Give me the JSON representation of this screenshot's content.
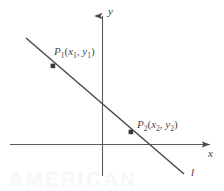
{
  "figure": {
    "type": "coordinate-geometry-diagram",
    "background_color": "#ffffff",
    "ink_color": "#4a4a4a",
    "axes": {
      "x_axis": {
        "label": "x",
        "label_position": {
          "x": 208,
          "y": 148
        },
        "start": {
          "x": 10,
          "y": 144
        },
        "end": {
          "x": 217,
          "y": 144
        },
        "arrow": "right"
      },
      "y_axis": {
        "label": "y",
        "label_position": {
          "x": 108,
          "y": 6
        },
        "start": {
          "x": 102,
          "y": 176
        },
        "end": {
          "x": 102,
          "y": 8
        },
        "arrow": "up"
      },
      "origin": {
        "x": 102,
        "y": 144
      }
    },
    "line": {
      "label": "l",
      "label_position": {
        "x": 191,
        "y": 167
      },
      "start": {
        "x": 26,
        "y": 38
      },
      "end": {
        "x": 185,
        "y": 175
      },
      "slope_sign": "negative"
    },
    "points": [
      {
        "name": "P1",
        "marker": {
          "x": 53,
          "y": 66
        },
        "label_text": "P",
        "label_sub": "1",
        "coord_open": "(",
        "coord_x": "x",
        "coord_x_sub": "1",
        "coord_sep": ", ",
        "coord_y": "y",
        "coord_y_sub": "1",
        "coord_close": ")",
        "full_label": "P1(x1, y1)"
      },
      {
        "name": "P2",
        "marker": {
          "x": 131,
          "y": 132
        },
        "label_text": "P",
        "label_sub": "2",
        "coord_open": "(",
        "coord_x": "x",
        "coord_x_sub": "2",
        "coord_sep": ", ",
        "coord_y": "y",
        "coord_y_sub": "2",
        "coord_close": ")",
        "full_label": "P2(x2, y2)"
      }
    ]
  }
}
